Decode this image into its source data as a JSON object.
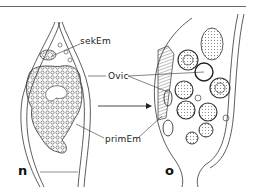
{
  "figure": {
    "panels": [
      {
        "id": "n",
        "letter": "n"
      },
      {
        "id": "o",
        "letter": "o"
      }
    ],
    "labels": {
      "secondary_embryos": "sekEm",
      "ovicell": "Ovic",
      "primary_embryo": "primEm"
    },
    "arrow": {
      "direction": "right",
      "from_panel": "n",
      "to_panel": "o"
    },
    "colors": {
      "ink": "#222222",
      "rule": "#6a6a6a",
      "background": "#ffffff"
    }
  }
}
